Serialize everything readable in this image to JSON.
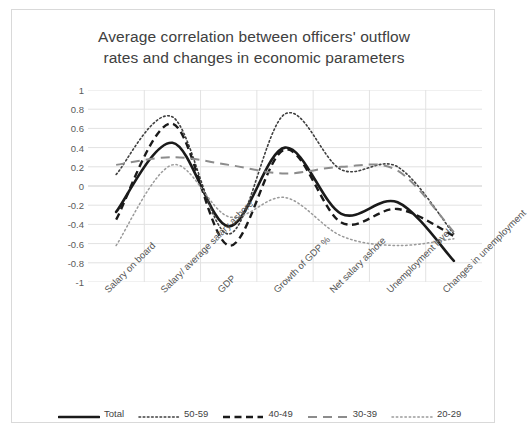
{
  "chart_data": {
    "type": "line",
    "title": "Average correlation between officers' outflow rates and changes in economic parameters",
    "title_line1": "Average correlation between officers' outflow",
    "title_line2": "rates and changes in economic parameters",
    "xlabel": "",
    "ylabel": "",
    "ylim": [
      -1,
      1
    ],
    "yticks": [
      "1",
      "0.8",
      "0.6",
      "0.4",
      "0.2",
      "0",
      "-0.2",
      "-0.4",
      "-0.6",
      "-0.8",
      "-1"
    ],
    "ytick_values": [
      1,
      0.8,
      0.6,
      0.4,
      0.2,
      0,
      -0.2,
      -0.4,
      -0.6,
      -0.8,
      -1
    ],
    "grid": true,
    "grid_color": "#e2e2e2",
    "legend_position": "bottom",
    "categories": [
      "Salary on board",
      "Salary/ average salary ashore",
      "GDP",
      "Growth of GDP %",
      "Net salary ashore",
      "Unemployment level",
      "Changes in unemployment"
    ],
    "series": [
      {
        "name": "Total",
        "style": "solid-thick",
        "color": "#1a1a1a",
        "values": [
          -0.27,
          0.45,
          -0.42,
          0.4,
          -0.29,
          -0.17,
          -0.78
        ]
      },
      {
        "name": "50-59",
        "style": "dotted",
        "color": "#3f3f3f",
        "values": [
          0.12,
          0.72,
          -0.5,
          0.75,
          0.17,
          0.2,
          -0.5
        ]
      },
      {
        "name": "40-49",
        "style": "dashed-bold",
        "color": "#1a1a1a",
        "values": [
          -0.35,
          0.65,
          -0.62,
          0.38,
          -0.38,
          -0.24,
          -0.52
        ]
      },
      {
        "name": "30-39",
        "style": "dashed-light",
        "color": "#8c8c8c",
        "values": [
          0.22,
          0.3,
          0.22,
          0.13,
          0.2,
          0.16,
          -0.48
        ]
      },
      {
        "name": "20-29",
        "style": "dotted-light",
        "color": "#9a9a9a",
        "values": [
          -0.62,
          0.22,
          -0.32,
          -0.12,
          -0.52,
          -0.62,
          -0.55
        ]
      }
    ]
  }
}
